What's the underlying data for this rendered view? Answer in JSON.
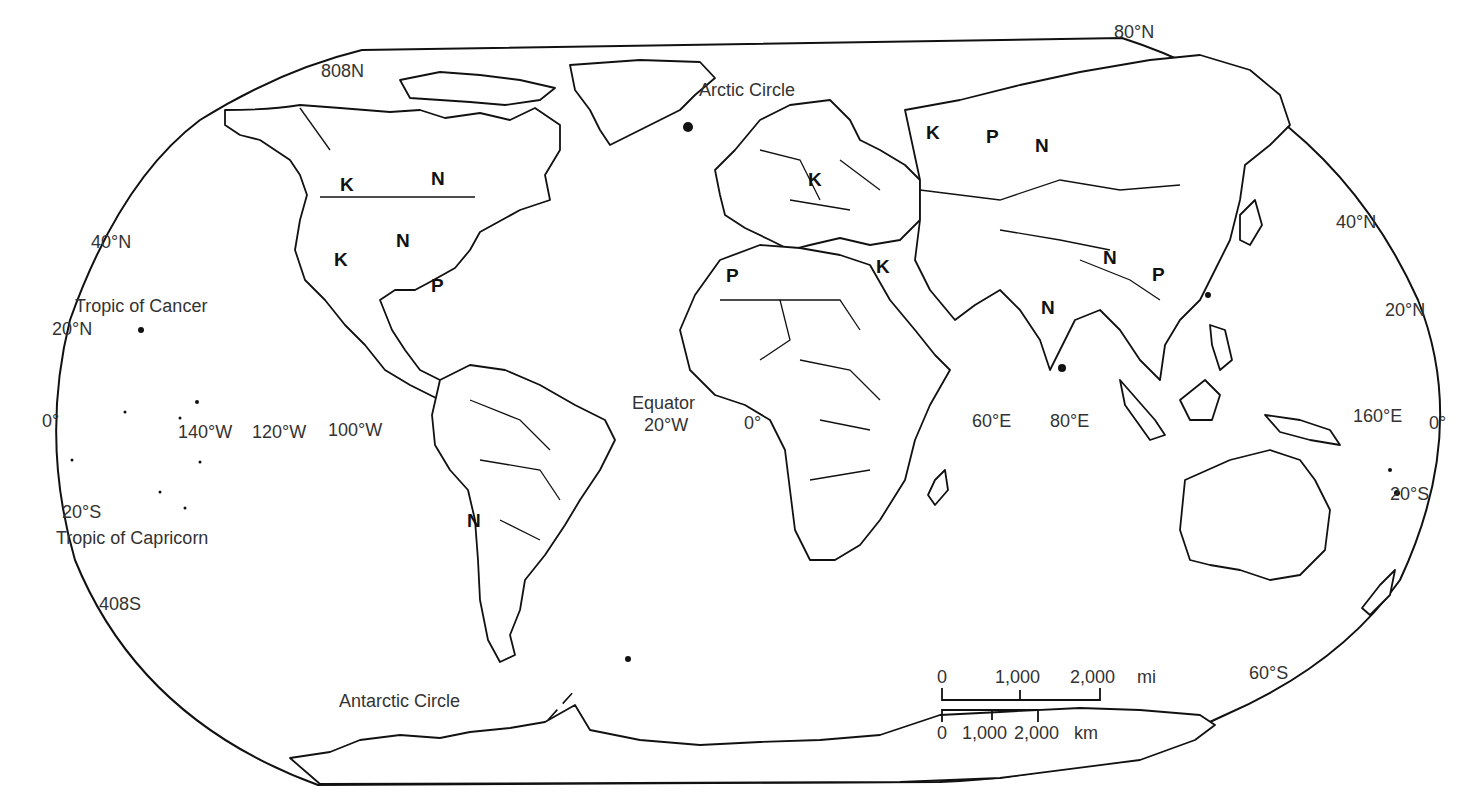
{
  "map": {
    "type": "world outline map",
    "background": "#ffffff",
    "line_color": "#111111",
    "latitude_labels": {
      "n80_left": "808N",
      "n80_right": "80°N",
      "n40_left": "40°N",
      "n40_right": "40°N",
      "n20_left": "20°N",
      "n20_right": "20°N",
      "eq_left": "0°",
      "eq_right": "0°",
      "s20_left": "20°S",
      "s20_right": "20°S",
      "s40_left": "408S",
      "s60_right": "60°S"
    },
    "longitude_labels": {
      "w140": "140°W",
      "w120": "120°W",
      "w100": "100°W",
      "w20": "20°W",
      "zero": "0°",
      "e60": "60°E",
      "e80": "80°E",
      "e160": "160°E"
    },
    "circles": {
      "arctic": "Arctic Circle",
      "antarctic": "Antarctic Circle",
      "cancer": "Tropic of Cancer",
      "capricorn": "Tropic of Capricorn",
      "equator": "Equator"
    },
    "markers": [
      {
        "letter": "K",
        "region": "western Canada"
      },
      {
        "letter": "N",
        "region": "eastern Canada"
      },
      {
        "letter": "N",
        "region": "central United States"
      },
      {
        "letter": "K",
        "region": "western United States"
      },
      {
        "letter": "P",
        "region": "Gulf of Mexico"
      },
      {
        "letter": "N",
        "region": "Chile"
      },
      {
        "letter": "P",
        "region": "northwest Africa"
      },
      {
        "letter": "K",
        "region": "eastern Europe"
      },
      {
        "letter": "K",
        "region": "Egypt"
      },
      {
        "letter": "K",
        "region": "western Russia"
      },
      {
        "letter": "P",
        "region": "central Russia"
      },
      {
        "letter": "N",
        "region": "eastern Russia"
      },
      {
        "letter": "N",
        "region": "India"
      },
      {
        "letter": "N",
        "region": "Himalaya"
      },
      {
        "letter": "P",
        "region": "China"
      }
    ],
    "scale_bar": {
      "miles": {
        "ticks": [
          "0",
          "1,000",
          "2,000"
        ],
        "unit": "mi"
      },
      "km": {
        "ticks": [
          "0",
          "1,000",
          "2,000"
        ],
        "unit": "km"
      }
    }
  }
}
